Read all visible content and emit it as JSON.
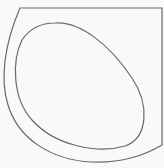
{
  "diagram": {
    "background": "#f9f9f9",
    "stroke_color": "#6a6a6a",
    "outer_rim": {
      "path": "M20 8 L162 8 L162 145 C140 158 118 163 92 162 C50 160 18 138 8 105 C0 80 4 45 20 8 Z"
    },
    "inner_basin": {
      "path": "M55 23 C80 21 110 45 132 78 C150 105 148 138 125 146 C98 154 55 146 32 120 C12 98 12 60 22 40 C30 28 42 23 55 23 Z"
    }
  }
}
